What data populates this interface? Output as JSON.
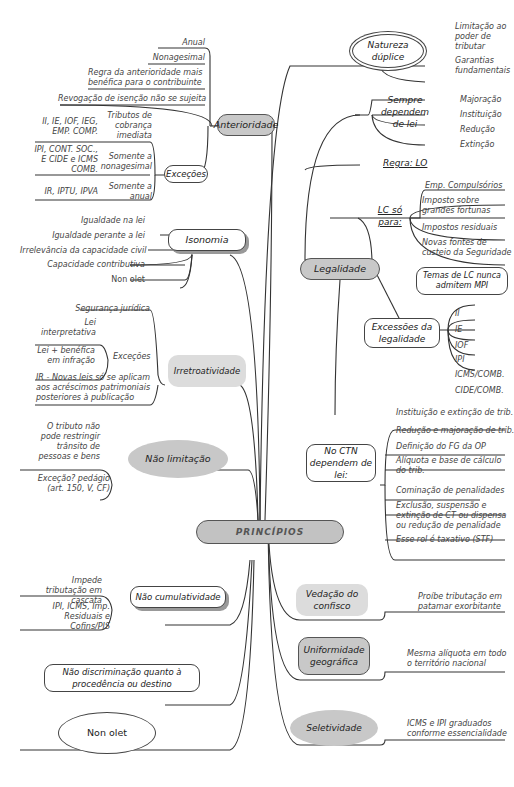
{
  "root": {
    "label": "PRINCÍPIOS"
  },
  "anterioridade": {
    "label": "Anterioridade",
    "items": [
      "Anual",
      "Nonagesimal",
      "Regra da anterioridade mais benéfica para o contribuinte",
      "Revogação de isenção não se sujeita"
    ],
    "excecoes": {
      "label": "Exceções",
      "groups": [
        {
          "type": "Tributos de cobrança imediata",
          "taxes": "II, IE, IOF, IEG, EMP. COMP."
        },
        {
          "type": "Somente a nonagesimal",
          "taxes": "IPI, CONT. SOC., E CIDE e ICMS COMB."
        },
        {
          "type": "Somente a anual",
          "taxes": "IR, IPTU, IPVA"
        }
      ]
    }
  },
  "isonomia": {
    "label": "Isonomia",
    "items": [
      "Igualdade na lei",
      "Igualdade perante a lei",
      "Irrelevância da capacidade civil",
      "Capacidade contributiva",
      "Non olet"
    ]
  },
  "irretroatividade": {
    "label": "Irretroatividade",
    "items": [
      "Segurança jurídica",
      "IR - Novas leis só se aplicam aos acréscimos patrimoniais posteriores à publicação"
    ],
    "excecoes": {
      "label": "Exceções",
      "items": [
        "Lei interpretativa",
        "Lei + benéfica em infração"
      ]
    }
  },
  "nao_limitacao": {
    "label": "Não limitação",
    "items": [
      "O tributo não pode restringir trânsito de pessoas e bens",
      "Exceção? pedágio (art. 150, V, CF)"
    ]
  },
  "nao_cumulatividade": {
    "label": "Não cumulatividade",
    "items": [
      "Impede tributação em cascata",
      "IPI, ICMS, Imp. Residuais e Cofins/PIS"
    ]
  },
  "nao_discriminacao": {
    "label": "Não discriminação quanto à procedência ou destino"
  },
  "non_olet": {
    "label": "Non olet"
  },
  "natureza": {
    "label": "Natureza dúplice",
    "items": [
      "Limitação ao poder de tributar",
      "Garantias fundamentais"
    ]
  },
  "legalidade": {
    "label": "Legalidade",
    "sempre": {
      "label": "Sempre dependem de lei",
      "items": [
        "Majoração",
        "Instituição",
        "Redução",
        "Extinção"
      ]
    },
    "regra": "Regra: LO",
    "lc": {
      "label": "LC só para:",
      "items": [
        "Emp. Compulsórios",
        "Imposto sobre grandes fortunas",
        "Impostos residuais",
        "Novas fontes de custeio da Seguridade"
      ],
      "note": "Temas de LC nunca admitem MPI"
    },
    "excessoes": {
      "label": "Excessões da legalidade",
      "items": [
        "II",
        "IE",
        "IOF",
        "IPI",
        "ICMS/COMB.",
        "CIDE/COMB."
      ]
    },
    "ctn": {
      "label": "No CTN dependem de lei:",
      "items": [
        "Instituição e extinção de trib.",
        "Redução e majoração de trib.",
        "Definição do FG da OP",
        "Alíquota e base de cálculo do trib.",
        "Cominação de penalidades",
        "Exclusão, suspensão e extinção de CT ou dispensa ou redução de penalidade",
        "Esse rol é taxativo (STF)"
      ]
    }
  },
  "vedacao": {
    "label": "Vedação do confisco",
    "item": "Proíbe tributação em patamar exorbitante"
  },
  "uniformidade": {
    "label": "Uniformidade geográfica",
    "item": "Mesma alíquota em todo o território nacional"
  },
  "seletividade": {
    "label": "Seletividade",
    "item": "ICMS e IPI graduados conforme essencialidade"
  }
}
